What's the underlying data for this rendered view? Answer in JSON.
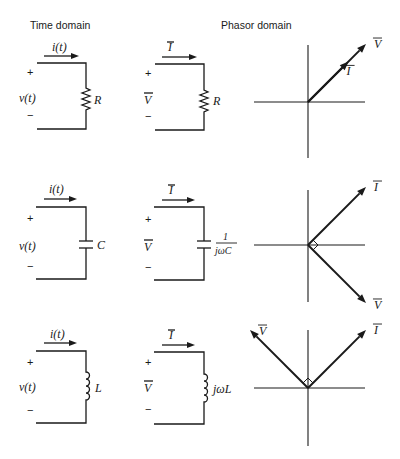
{
  "headers": {
    "time_domain": "Time domain",
    "phasor_domain": "Phasor domain"
  },
  "symbols": {
    "plus": "+",
    "minus": "−"
  },
  "rows": [
    {
      "element": "resistor",
      "time": {
        "current": "i(t)",
        "voltage": "v(t)",
        "component": "R"
      },
      "phasor": {
        "current": "I",
        "voltage": "V",
        "impedance": "R"
      },
      "diagram": {
        "V": {
          "angle_deg": 45,
          "length": 1.0,
          "label": "V"
        },
        "I": {
          "angle_deg": 45,
          "length": 0.7,
          "label": "I"
        },
        "right_angle_marker": false,
        "relation": "in phase"
      }
    },
    {
      "element": "capacitor",
      "time": {
        "current": "i(t)",
        "voltage": "v(t)",
        "component": "C"
      },
      "phasor": {
        "current": "I",
        "voltage": "V",
        "impedance_num": "1",
        "impedance_den": "jωC"
      },
      "diagram": {
        "I": {
          "angle_deg": 45,
          "length": 1.0,
          "label": "I"
        },
        "V": {
          "angle_deg": -45,
          "length": 1.0,
          "label": "V"
        },
        "right_angle_marker": true,
        "relation": "current leads voltage by 90°"
      }
    },
    {
      "element": "inductor",
      "time": {
        "current": "i(t)",
        "voltage": "v(t)",
        "component": "L"
      },
      "phasor": {
        "current": "I",
        "voltage": "V",
        "impedance": "jωL"
      },
      "diagram": {
        "V": {
          "angle_deg": 135,
          "length": 1.0,
          "label": "V"
        },
        "I": {
          "angle_deg": 45,
          "length": 1.0,
          "label": "I"
        },
        "right_angle_marker": true,
        "relation": "voltage leads current by 90°"
      }
    }
  ]
}
